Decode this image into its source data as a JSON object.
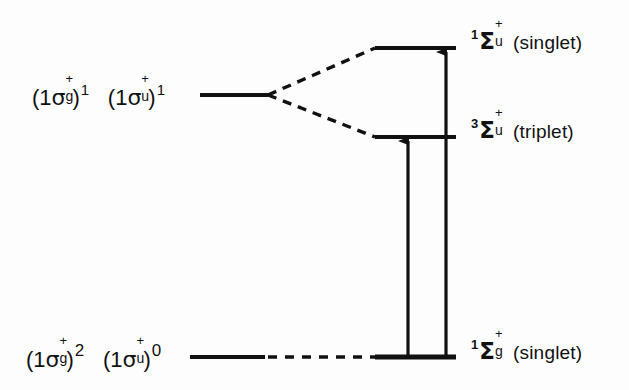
{
  "diagram": {
    "background_color": "#fdfdfd",
    "line_color": "#111111",
    "levels": [
      {
        "id": "excited-configuration",
        "configuration_text": "(1σg+)1 (1σu+)1",
        "orbital_1": {
          "prefix": "(",
          "n": "1",
          "symbol": "σ",
          "superscript": "+",
          "subscript": "g",
          "close": ")",
          "occupancy": "1"
        },
        "orbital_2": {
          "prefix": "(",
          "n": "1",
          "symbol": "σ",
          "superscript": "+",
          "subscript": "u",
          "close": ")",
          "occupancy": "1"
        },
        "style": "solid",
        "x1": 200,
        "x2": 268,
        "y": 95
      },
      {
        "id": "ground-configuration",
        "configuration_text": "(1σg+)2 (1σu+)0",
        "orbital_1": {
          "prefix": "(",
          "n": "1",
          "symbol": "σ",
          "superscript": "+",
          "subscript": "g",
          "close": ")",
          "occupancy": "2"
        },
        "orbital_2": {
          "prefix": "(",
          "n": "1",
          "symbol": "σ",
          "superscript": "+",
          "subscript": "u",
          "close": ")",
          "occupancy": "0"
        },
        "style": "solid",
        "x1": 190,
        "x2": 265,
        "y": 357
      }
    ],
    "terms": [
      {
        "id": "singlet-sigma-u",
        "multiplicity": "1",
        "symbol": "Σ",
        "parity": "u",
        "superscript": "+",
        "name": "(singlet)",
        "full_text": "1Σu+ (singlet)",
        "x1": 375,
        "x2": 455,
        "y": 48,
        "label_x": 470,
        "label_y": 30
      },
      {
        "id": "triplet-sigma-u",
        "multiplicity": "3",
        "symbol": "Σ",
        "parity": "u",
        "superscript": "+",
        "name": "(triplet)",
        "full_text": "3Σu+ (triplet)",
        "x1": 375,
        "x2": 455,
        "y": 137,
        "label_x": 470,
        "label_y": 119
      },
      {
        "id": "singlet-sigma-g",
        "multiplicity": "1",
        "symbol": "Σ",
        "parity": "g",
        "superscript": "+",
        "name": "(singlet)",
        "full_text": "1Σg+ (singlet)",
        "x1": 375,
        "x2": 455,
        "y": 357,
        "label_x": 470,
        "label_y": 340
      }
    ],
    "connectors": [
      {
        "id": "split-to-singlet",
        "style": "dashed",
        "from_x": 268,
        "from_y": 95,
        "to_x": 375,
        "to_y": 48
      },
      {
        "id": "split-to-triplet",
        "style": "dashed",
        "from_x": 268,
        "from_y": 95,
        "to_x": 375,
        "to_y": 137
      },
      {
        "id": "ground-connector",
        "style": "dashed",
        "from_x": 268,
        "from_y": 357,
        "to_x": 375,
        "to_y": 357
      }
    ],
    "transitions": [
      {
        "id": "triplet-excitation-arrow",
        "direction": "up",
        "x": 408,
        "from_y": 357,
        "to_y": 139
      },
      {
        "id": "singlet-excitation-arrow",
        "direction": "up",
        "x": 446,
        "from_y": 357,
        "to_y": 50
      }
    ]
  }
}
